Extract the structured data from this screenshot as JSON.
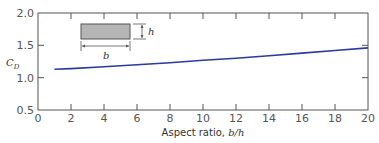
{
  "chart_data": {
    "type": "line",
    "title": "",
    "xlabel_text": "Aspect ratio, ",
    "xlabel_var": "b/h",
    "ylabel_main": "C",
    "ylabel_sub": "D",
    "xlim": [
      0,
      20
    ],
    "ylim": [
      0.5,
      2.0
    ],
    "xticks": [
      "0",
      "2",
      "4",
      "6",
      "8",
      "10",
      "12",
      "14",
      "16",
      "18",
      "20"
    ],
    "yticks": [
      "0.5",
      "1.0",
      "1.5",
      "2.0"
    ],
    "grid": false,
    "series": [
      {
        "name": "C_D vs aspect ratio",
        "color": "#2b3a9e",
        "x": [
          1,
          2,
          4,
          6,
          8,
          10,
          12,
          14,
          16,
          18,
          20
        ],
        "y": [
          1.13,
          1.14,
          1.17,
          1.2,
          1.23,
          1.27,
          1.3,
          1.34,
          1.38,
          1.42,
          1.46
        ]
      }
    ],
    "inset": {
      "description": "Rectangular cross-section with width b and height h",
      "width_label": "b",
      "height_label": "h"
    }
  }
}
